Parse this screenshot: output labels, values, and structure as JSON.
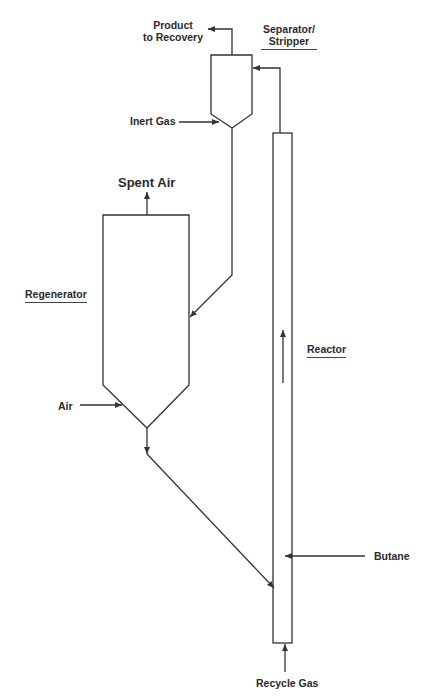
{
  "diagram": {
    "type": "process-flow",
    "units": {
      "separator": {
        "label_line1": "Separator/",
        "label_line2": "Stripper"
      },
      "regenerator": {
        "label": "Regenerator"
      },
      "reactor": {
        "label": "Reactor"
      }
    },
    "streams": {
      "product": {
        "label_line1": "Product",
        "label_line2": "to Recovery"
      },
      "inert_gas": {
        "label": "Inert Gas"
      },
      "spent_air": {
        "label": "Spent Air"
      },
      "air": {
        "label": "Air"
      },
      "butane": {
        "label": "Butane"
      },
      "recycle_gas": {
        "label": "Recycle Gas"
      }
    },
    "colors": {
      "line": "#333333",
      "text": "#2a2a2a",
      "background": "#ffffff"
    }
  }
}
